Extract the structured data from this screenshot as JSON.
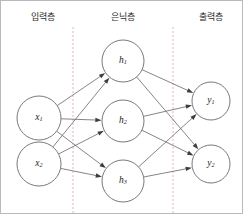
{
  "figure": {
    "width": 243,
    "height": 214,
    "background_color": "#ffffff",
    "border_color": "#b9b9b9"
  },
  "layer_labels": [
    {
      "text": "입력층",
      "meaning": "input layer",
      "x": 42,
      "y": 17
    },
    {
      "text": "은닉층",
      "meaning": "hidden layer",
      "x": 122,
      "y": 17
    },
    {
      "text": "출력층",
      "meaning": "output layer",
      "x": 210,
      "y": 17
    }
  ],
  "dividers": [
    {
      "x": 72,
      "y1": 26,
      "y2": 212,
      "color": "#d9b9bc",
      "style": "dashed"
    },
    {
      "x": 172,
      "y1": 26,
      "y2": 212,
      "color": "#d9b9bc",
      "style": "dashed"
    }
  ],
  "nodes": {
    "input": [
      {
        "id": "x1",
        "base": "x",
        "sub": "1",
        "cx": 38,
        "cy": 117,
        "r": 22
      },
      {
        "id": "x2",
        "base": "x",
        "sub": "2",
        "cx": 38,
        "cy": 163,
        "r": 22
      }
    ],
    "hidden": [
      {
        "id": "h1",
        "base": "h",
        "sub": "1",
        "cx": 122,
        "cy": 60,
        "r": 21
      },
      {
        "id": "h2",
        "base": "h",
        "sub": "2",
        "cx": 122,
        "cy": 120,
        "r": 21
      },
      {
        "id": "h3",
        "base": "h",
        "sub": "3",
        "cx": 122,
        "cy": 180,
        "r": 21
      }
    ],
    "output": [
      {
        "id": "y1",
        "base": "y",
        "sub": "1",
        "cx": 210,
        "cy": 100,
        "r": 19
      },
      {
        "id": "y2",
        "base": "y",
        "sub": "2",
        "cx": 210,
        "cy": 163,
        "r": 19
      }
    ]
  },
  "edges": [
    {
      "from": "x1",
      "to": "h1"
    },
    {
      "from": "x1",
      "to": "h2"
    },
    {
      "from": "x1",
      "to": "h3"
    },
    {
      "from": "x2",
      "to": "h1"
    },
    {
      "from": "x2",
      "to": "h2"
    },
    {
      "from": "x2",
      "to": "h3"
    },
    {
      "from": "h1",
      "to": "y1"
    },
    {
      "from": "h1",
      "to": "y2"
    },
    {
      "from": "h2",
      "to": "y1"
    },
    {
      "from": "h2",
      "to": "y2"
    },
    {
      "from": "h3",
      "to": "y1"
    },
    {
      "from": "h3",
      "to": "y2"
    }
  ],
  "style": {
    "edge_color": "#6f6f6f",
    "node_stroke_color": "#6a6a6a",
    "node_fill_color": "#ffffff",
    "arrowhead_color": "#3d3d3d",
    "label_color": "#1a1a1a",
    "layer_label_color": "#2b2b2b"
  }
}
